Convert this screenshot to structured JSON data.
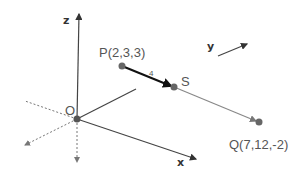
{
  "diagram": {
    "type": "3d-coordinate-vector-diagram",
    "axes": {
      "x_label": "x",
      "y_label": "y",
      "z_label": "z",
      "origin_label": "O"
    },
    "points": {
      "P": {
        "label": "P(2,3,3)"
      },
      "S": {
        "label": "S"
      },
      "Q": {
        "label": "Q(7,12,-2)"
      }
    },
    "segment_PS_length": "4",
    "colors": {
      "axis": "#444444",
      "point": "#666666",
      "vector_PS": "#111111",
      "vector_SQ": "#888888",
      "dotted": "#777777"
    }
  }
}
